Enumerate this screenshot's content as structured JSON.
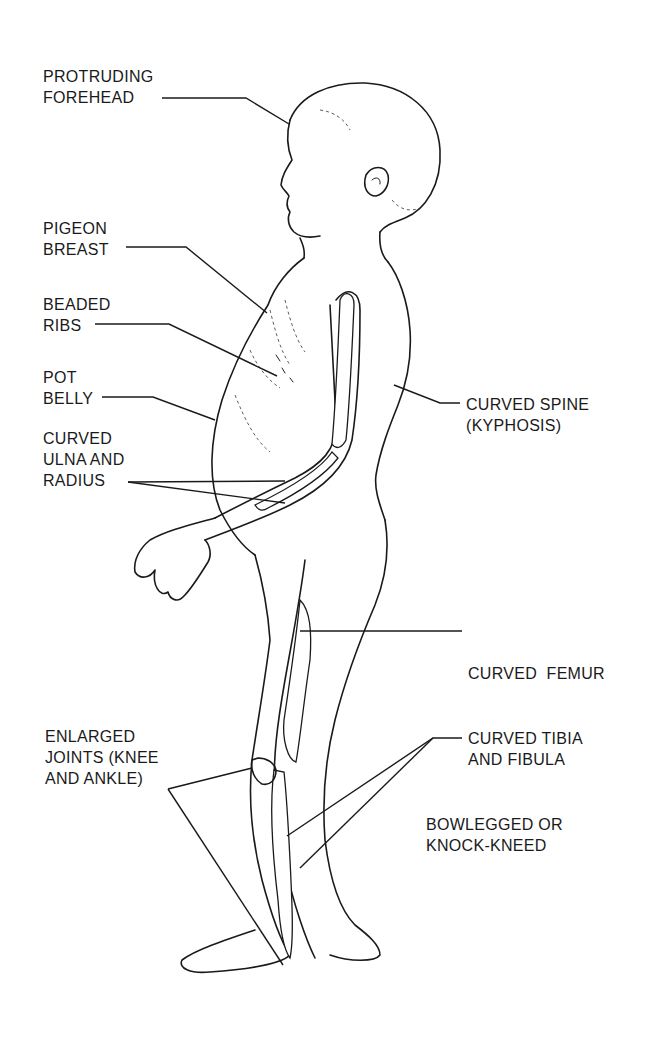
{
  "diagram": {
    "background": "#ffffff",
    "ink_color": "#1a1a1a",
    "labels": [
      {
        "id": "forehead",
        "lines": [
          "PROTRUDING",
          "FOREHEAD"
        ]
      },
      {
        "id": "pigeon_breast",
        "lines": [
          "PIGEON",
          "BREAST"
        ]
      },
      {
        "id": "beaded_ribs",
        "lines": [
          "BEADED",
          "RIBS"
        ]
      },
      {
        "id": "pot_belly",
        "lines": [
          "POT",
          "BELLY"
        ]
      },
      {
        "id": "ulna_radius",
        "lines": [
          "CURVED",
          "ULNA AND",
          "RADIUS"
        ]
      },
      {
        "id": "spine",
        "lines": [
          "CURVED SPINE",
          "(KYPHOSIS)"
        ]
      },
      {
        "id": "femur",
        "lines": [
          "CURVED  FEMUR"
        ]
      },
      {
        "id": "joints",
        "lines": [
          "ENLARGED",
          "JOINTS (KNEE",
          "AND ANKLE)"
        ]
      },
      {
        "id": "tibia_fibula",
        "lines": [
          "CURVED TIBIA",
          "AND FIBULA"
        ]
      },
      {
        "id": "legs",
        "lines": [
          "BOWLEGGED OR",
          "KNOCK-KNEED"
        ]
      }
    ]
  }
}
